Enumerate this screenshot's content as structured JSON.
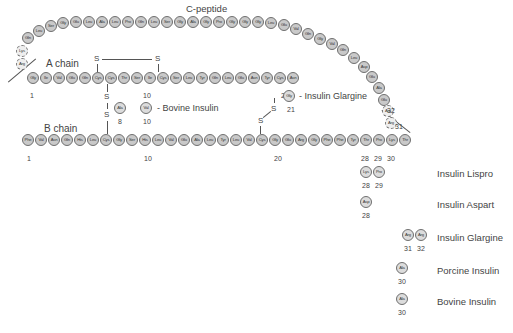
{
  "title": "C-peptide",
  "labels": {
    "a_chain": "A chain",
    "b_chain": "B chain",
    "bovine_a": "- Bovine Insulin",
    "glargine_a": "- Insulin Glargine"
  },
  "connecting_beads": [
    {
      "aa": "Arg",
      "x": 16,
      "y": 58,
      "dashed": true
    },
    {
      "aa": "Lys",
      "x": 16,
      "y": 45,
      "dashed": true
    },
    {
      "aa": "Gln",
      "x": 22,
      "y": 32
    },
    {
      "aa": "Leu",
      "x": 33,
      "y": 25
    },
    {
      "aa": "Ser",
      "x": 45,
      "y": 20
    },
    {
      "aa": "Gly",
      "x": 57,
      "y": 17
    },
    {
      "aa": "Glu",
      "x": 70,
      "y": 16
    },
    {
      "aa": "Leu",
      "x": 83,
      "y": 16
    },
    {
      "aa": "Ala",
      "x": 96,
      "y": 16
    },
    {
      "aa": "Leu",
      "x": 109,
      "y": 16
    },
    {
      "aa": "Pro",
      "x": 122,
      "y": 16
    },
    {
      "aa": "Gln",
      "x": 135,
      "y": 16
    },
    {
      "aa": "Leu",
      "x": 148,
      "y": 16
    },
    {
      "aa": "Ser",
      "x": 161,
      "y": 16
    },
    {
      "aa": "Gly",
      "x": 174,
      "y": 16
    },
    {
      "aa": "Ala",
      "x": 187,
      "y": 16
    },
    {
      "aa": "Gly",
      "x": 200,
      "y": 16
    },
    {
      "aa": "Pro",
      "x": 213,
      "y": 16
    },
    {
      "aa": "Gly",
      "x": 226,
      "y": 16
    },
    {
      "aa": "Gly",
      "x": 239,
      "y": 16
    },
    {
      "aa": "Gly",
      "x": 252,
      "y": 16
    },
    {
      "aa": "Leu",
      "x": 265,
      "y": 17
    },
    {
      "aa": "Glu",
      "x": 278,
      "y": 19
    },
    {
      "aa": "Val",
      "x": 290,
      "y": 23
    },
    {
      "aa": "Gln",
      "x": 302,
      "y": 28
    },
    {
      "aa": "Gly",
      "x": 314,
      "y": 33
    },
    {
      "aa": "Val",
      "x": 326,
      "y": 38
    },
    {
      "aa": "Gln",
      "x": 337,
      "y": 44
    },
    {
      "aa": "Leu",
      "x": 348,
      "y": 52
    },
    {
      "aa": "Asp",
      "x": 358,
      "y": 61
    },
    {
      "aa": "Glu",
      "x": 366,
      "y": 71
    },
    {
      "aa": "Ala",
      "x": 373,
      "y": 82
    },
    {
      "aa": "Glu",
      "x": 378,
      "y": 94
    },
    {
      "aa": "Arg",
      "x": 382,
      "y": 105,
      "dashed": true
    },
    {
      "aa": "Arg",
      "x": 385,
      "y": 117,
      "dashed": true
    }
  ],
  "a_chain": {
    "x0": 27,
    "y": 72,
    "step": 13,
    "residues": [
      "Gly",
      "Ile",
      "Val",
      "Glu",
      "Gln",
      "Cys",
      "Cys",
      "Thr",
      "Ser",
      "Ile",
      "Cys",
      "Ser",
      "Leu",
      "Tyr",
      "Gln",
      "Leu",
      "Glu",
      "Asn",
      "Tyr",
      "Cys",
      "Asn"
    ],
    "numbers": [
      {
        "text": "1",
        "x": 30,
        "y": 92
      },
      {
        "text": "10",
        "x": 143,
        "y": 92
      },
      {
        "text": "20",
        "x": 281,
        "y": 92
      }
    ]
  },
  "b_chain": {
    "x0": 22,
    "y": 134,
    "step": 13,
    "residues": [
      "Phe",
      "Val",
      "Asn",
      "Gln",
      "His",
      "Leu",
      "Cys",
      "Gly",
      "Ser",
      "His",
      "Leu",
      "Val",
      "Glu",
      "Ala",
      "Leu",
      "Tyr",
      "Leu",
      "Val",
      "Cys",
      "Gly",
      "Glu",
      "Arg",
      "Gly",
      "Phe",
      "Phe",
      "Tyr",
      "Thr",
      "Pro",
      "Lys",
      "Thr"
    ],
    "numbers": [
      {
        "text": "1",
        "x": 27,
        "y": 155
      },
      {
        "text": "10",
        "x": 144,
        "y": 155
      },
      {
        "text": "20",
        "x": 274,
        "y": 155
      },
      {
        "text": "28",
        "x": 361,
        "y": 155
      },
      {
        "text": "29",
        "x": 374,
        "y": 155
      },
      {
        "text": "30",
        "x": 387,
        "y": 155
      }
    ]
  },
  "variants_inline": [
    {
      "aa": "Ala",
      "x": 114,
      "y": 102,
      "num": "8",
      "nx": 118,
      "ny": 118
    },
    {
      "aa": "Val",
      "x": 140,
      "y": 102,
      "num": "10",
      "nx": 143,
      "ny": 118
    },
    {
      "aa": "Gly",
      "x": 283,
      "y": 90,
      "num": "21",
      "nx": 287,
      "ny": 106
    }
  ],
  "variants_table": [
    {
      "name": "Insulin Lispro",
      "beads": [
        {
          "aa": "Lys",
          "x": 360
        },
        {
          "aa": "Pro",
          "x": 373
        }
      ],
      "y": 166,
      "nums": [
        "28",
        "29"
      ],
      "name_y": 168
    },
    {
      "name": "Insulin Aspart",
      "beads": [
        {
          "aa": "Asp",
          "x": 360
        }
      ],
      "y": 196,
      "nums": [
        "28"
      ],
      "name_y": 199
    },
    {
      "name": "Insulin Glargine",
      "beads": [
        {
          "aa": "Arg",
          "x": 402
        },
        {
          "aa": "Arg",
          "x": 415
        }
      ],
      "y": 229,
      "nums": [
        "31",
        "32"
      ],
      "name_y": 232
    },
    {
      "name": "Porcine Insulin",
      "beads": [
        {
          "aa": "Ala",
          "x": 396
        }
      ],
      "y": 262,
      "nums": [
        "30"
      ],
      "name_y": 265
    },
    {
      "name": "Bovine Insulin",
      "beads": [
        {
          "aa": "Ala",
          "x": 396
        }
      ],
      "y": 293,
      "nums": [
        "30"
      ],
      "name_y": 296
    }
  ],
  "side_numbers": [
    {
      "text": "32",
      "x": 387,
      "y": 107
    },
    {
      "text": "31",
      "x": 395,
      "y": 123
    }
  ],
  "disulfide": {
    "s": "S"
  }
}
